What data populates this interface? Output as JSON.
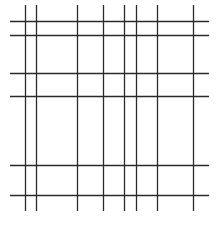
{
  "diagram": {
    "type": "line-grid",
    "line_color": "#2a2a2a",
    "background_color": "#ffffff",
    "vertical_line_count": 8,
    "horizontal_line_count": 6
  }
}
